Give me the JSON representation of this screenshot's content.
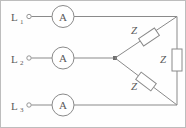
{
  "diagram": {
    "stroke_color": "#8a8a8a",
    "text_color": "#5a5a5a",
    "background_color": "#fefefe",
    "border_color": "#bdbdbd",
    "lines": [
      {
        "label": "L",
        "subscript": "1",
        "meter": "A"
      },
      {
        "label": "L",
        "subscript": "2",
        "meter": "A"
      },
      {
        "label": "L",
        "subscript": "3",
        "meter": "A"
      }
    ],
    "impedances": [
      {
        "label": "Z",
        "position": "upper-diagonal"
      },
      {
        "label": "Z",
        "position": "right-vertical"
      },
      {
        "label": "Z",
        "position": "lower-diagonal"
      }
    ]
  }
}
